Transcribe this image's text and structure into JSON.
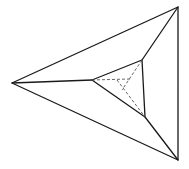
{
  "diagram": {
    "width": 189,
    "height": 169,
    "background": "#ffffff",
    "stroke_color": "#1a1a1a",
    "dashed_color": "#555555",
    "outer_triangle": [
      [
        12,
        83
      ],
      [
        178,
        7
      ],
      [
        178,
        160
      ]
    ],
    "inner_triangle": [
      [
        92,
        80
      ],
      [
        142,
        60
      ],
      [
        145,
        117
      ]
    ],
    "connecting_edges": [
      [
        [
          12,
          83
        ],
        [
          92,
          80
        ]
      ],
      [
        [
          178,
          7
        ],
        [
          142,
          60
        ]
      ],
      [
        [
          178,
          160
        ],
        [
          145,
          117
        ]
      ]
    ],
    "dashed_edges": [
      [
        [
          92,
          80
        ],
        [
          130,
          79
        ]
      ],
      [
        [
          142,
          60
        ],
        [
          122,
          90
        ]
      ],
      [
        [
          117,
          80
        ],
        [
          145,
          117
        ]
      ]
    ]
  }
}
